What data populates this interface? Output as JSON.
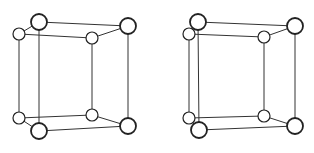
{
  "figure": {
    "colors": {
      "background": "#ffffff",
      "stroke": "#222222",
      "atom_fill": "#ffffff"
    },
    "cells": [
      {
        "name": "left-cell",
        "atoms": [
          {
            "id": "A",
            "x": 39,
            "y": 22,
            "r": 8,
            "size": "big"
          },
          {
            "id": "B",
            "x": 128,
            "y": 26,
            "r": 8,
            "size": "big"
          },
          {
            "id": "C",
            "x": 19,
            "y": 34,
            "r": 6,
            "size": "small"
          },
          {
            "id": "D",
            "x": 92,
            "y": 38,
            "r": 6,
            "size": "small"
          },
          {
            "id": "E",
            "x": 19,
            "y": 118,
            "r": 6,
            "size": "small"
          },
          {
            "id": "F",
            "x": 92,
            "y": 115,
            "r": 6,
            "size": "small"
          },
          {
            "id": "G",
            "x": 39,
            "y": 131,
            "r": 8,
            "size": "big"
          },
          {
            "id": "H",
            "x": 128,
            "y": 126,
            "r": 8,
            "size": "big"
          }
        ]
      },
      {
        "name": "right-cell",
        "atoms": [
          {
            "id": "A",
            "x": 198,
            "y": 22,
            "r": 8,
            "size": "big"
          },
          {
            "id": "B",
            "x": 295,
            "y": 26,
            "r": 8,
            "size": "big"
          },
          {
            "id": "C",
            "x": 189,
            "y": 34,
            "r": 6,
            "size": "small"
          },
          {
            "id": "D",
            "x": 264,
            "y": 37,
            "r": 6,
            "size": "small"
          },
          {
            "id": "E",
            "x": 189,
            "y": 118,
            "r": 6,
            "size": "small"
          },
          {
            "id": "F",
            "x": 264,
            "y": 116,
            "r": 6,
            "size": "small"
          },
          {
            "id": "G",
            "x": 199,
            "y": 130,
            "r": 8,
            "size": "big"
          },
          {
            "id": "H",
            "x": 295,
            "y": 126,
            "r": 8,
            "size": "big"
          }
        ]
      }
    ],
    "edges": [
      [
        "A",
        "B"
      ],
      [
        "C",
        "D"
      ],
      [
        "A",
        "C"
      ],
      [
        "B",
        "D"
      ],
      [
        "E",
        "F"
      ],
      [
        "G",
        "H"
      ],
      [
        "E",
        "G"
      ],
      [
        "F",
        "H"
      ],
      [
        "A",
        "G"
      ],
      [
        "B",
        "H"
      ],
      [
        "C",
        "E"
      ],
      [
        "D",
        "F"
      ]
    ]
  }
}
